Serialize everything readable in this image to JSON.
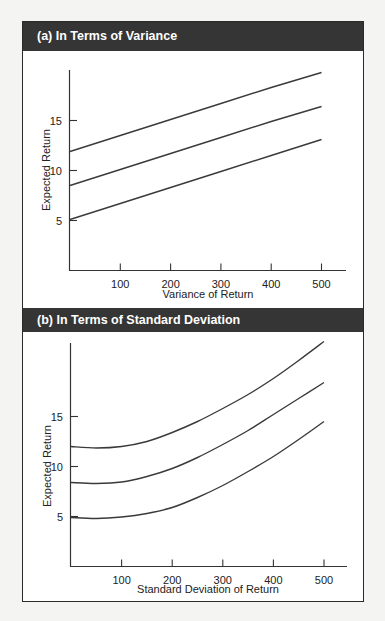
{
  "panels": {
    "a": {
      "title": "(a)  In Terms of Variance"
    },
    "b": {
      "title": "(b)  In Terms of Standard Deviation"
    }
  },
  "chart_data": [
    {
      "type": "line",
      "title": "(a) In Terms of Variance",
      "xlabel": "Variance of Return",
      "ylabel": "Expected Return",
      "xticks": [
        100,
        200,
        300,
        400,
        500
      ],
      "yticks": [
        5,
        10,
        15
      ],
      "xlim": [
        0,
        550
      ],
      "ylim": [
        0,
        20
      ],
      "grid": false,
      "x": [
        0,
        100,
        200,
        300,
        400,
        500
      ],
      "series": [
        {
          "name": "upper",
          "values": [
            11.9,
            13.5,
            15.1,
            16.7,
            18.3,
            19.8
          ]
        },
        {
          "name": "middle",
          "values": [
            8.5,
            10.1,
            11.7,
            13.3,
            14.9,
            16.4
          ]
        },
        {
          "name": "lower",
          "values": [
            5.1,
            6.7,
            8.3,
            9.9,
            11.5,
            13.1
          ]
        }
      ]
    },
    {
      "type": "line",
      "title": "(b) In Terms of Standard Deviation",
      "xlabel": "Standard Deviation of Return",
      "ylabel": "Expected Return",
      "xticks": [
        100,
        200,
        300,
        400,
        500
      ],
      "yticks": [
        5,
        10,
        15
      ],
      "xlim": [
        0,
        550
      ],
      "ylim": [
        0,
        22.5
      ],
      "grid": false,
      "x": [
        0,
        50,
        100,
        150,
        200,
        250,
        300,
        350,
        400,
        450,
        500
      ],
      "series": [
        {
          "name": "upper",
          "values": [
            12.0,
            11.85,
            12.0,
            12.5,
            13.4,
            14.5,
            15.8,
            17.2,
            18.8,
            20.6,
            22.5
          ]
        },
        {
          "name": "middle",
          "values": [
            8.4,
            8.3,
            8.45,
            9.0,
            9.8,
            10.9,
            12.2,
            13.6,
            15.2,
            16.8,
            18.4
          ]
        },
        {
          "name": "lower",
          "values": [
            4.9,
            4.8,
            4.95,
            5.3,
            5.9,
            6.9,
            8.1,
            9.5,
            11.0,
            12.7,
            14.5
          ]
        }
      ]
    }
  ]
}
